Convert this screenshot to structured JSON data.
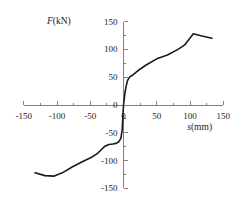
{
  "chart_data": {
    "type": "line",
    "title": "",
    "subtitle": "",
    "xlabel": "s(mm)",
    "ylabel": "F(kN)",
    "xlabel_italic_part": "s",
    "xlabel_rest": "(mm)",
    "ylabel_italic_part": "F",
    "ylabel_rest": "(kN)",
    "xlim": [
      -150,
      150
    ],
    "ylim": [
      -150,
      150
    ],
    "xticks": [
      -150,
      -100,
      -50,
      0,
      50,
      100,
      150
    ],
    "xtick_labels": [
      "-150",
      "-100",
      "-50",
      "0",
      "50",
      "100",
      "150"
    ],
    "yticks": [
      -150,
      -100,
      -50,
      0,
      50,
      100,
      150
    ],
    "ytick_labels": [
      "-150",
      "-100",
      "-50",
      "0",
      "50",
      "100",
      "150"
    ],
    "minor_tick_step": 25,
    "grid": false,
    "legend": false,
    "legend_position": "none",
    "axis_color": "#808080",
    "curve_color": "#1a1a1a",
    "curve_width": 1.6,
    "series": [
      {
        "name": "load-displacement",
        "x": [
          -133,
          -118,
          -105,
          -92,
          -78,
          -62,
          -48,
          -40,
          -33,
          -28,
          -22,
          -16,
          -11,
          -7,
          -4,
          -2,
          0,
          2,
          4,
          6,
          9,
          14,
          22,
          34,
          50,
          66,
          82,
          92,
          105,
          118,
          133
        ],
        "y": [
          -122,
          -127,
          -128,
          -122,
          -112,
          -102,
          -94,
          -88,
          -80,
          -74,
          -71,
          -70,
          -69,
          -66,
          -60,
          -45,
          0,
          20,
          34,
          44,
          50,
          54,
          62,
          72,
          83,
          90,
          100,
          108,
          128,
          124,
          120
        ]
      }
    ],
    "annotations": []
  }
}
